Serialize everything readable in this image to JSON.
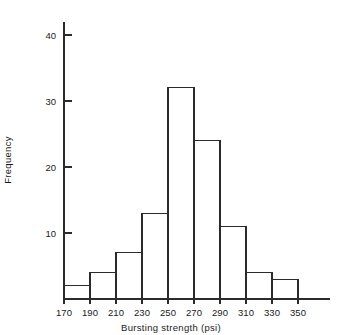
{
  "chart_data": {
    "type": "bar",
    "title": "",
    "xlabel": "Bursting strength  (psi)",
    "ylabel": "Frequency",
    "categories": [
      "170-190",
      "190-210",
      "210-230",
      "230-250",
      "250-270",
      "270-290",
      "290-310",
      "310-330",
      "330-350"
    ],
    "bin_edges": [
      170,
      190,
      210,
      230,
      250,
      270,
      290,
      310,
      330,
      350
    ],
    "values": [
      2,
      4,
      7,
      13,
      32,
      24,
      11,
      4,
      3
    ],
    "bin_width": 20,
    "xlim": [
      170,
      350
    ],
    "ylim": [
      0,
      44
    ],
    "x_tick_labels": [
      "170",
      "190",
      "210",
      "230",
      "250",
      "270",
      "290",
      "310",
      "330",
      "350"
    ],
    "x_tick_values": [
      170,
      190,
      210,
      230,
      250,
      270,
      290,
      310,
      330,
      350
    ],
    "y_tick_labels": [
      "10",
      "20",
      "30",
      "40"
    ],
    "y_tick_values": [
      10,
      20,
      30,
      40
    ],
    "grid": false,
    "legend": false,
    "bar_style": "outline",
    "colors": {
      "bar_stroke": "#2b2b2b",
      "bar_fill": "none",
      "axis": "#2b2b2b",
      "text": "#1a1a1a",
      "background": "#ffffff"
    }
  }
}
